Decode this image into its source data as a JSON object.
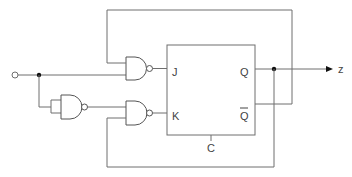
{
  "diagram": {
    "type": "logic-circuit",
    "flipflop": {
      "inputs": [
        "J",
        "K",
        "C"
      ],
      "outputs": [
        "Q",
        "Q̅"
      ],
      "labels": {
        "j": "J",
        "k": "K",
        "clock": "C",
        "q": "Q",
        "qbar": "Q"
      }
    },
    "gates": [
      {
        "id": "nand-top",
        "type": "NAND",
        "inputs": [
          "Q-bar feedback",
          "x"
        ],
        "output": "J"
      },
      {
        "id": "nand-inverter",
        "type": "NAND",
        "inputs": [
          "x",
          "x"
        ],
        "output": "to nand-bottom"
      },
      {
        "id": "nand-bottom",
        "type": "NAND",
        "inputs": [
          "not x",
          "Q feedback"
        ],
        "output": "K"
      }
    ],
    "external_input": {
      "symbol": "open-circle"
    },
    "output": {
      "label": "z"
    },
    "colors": {
      "wire": "#6e6e6e",
      "gate": "#555555",
      "junction": "#111111",
      "background": "#ffffff"
    }
  }
}
